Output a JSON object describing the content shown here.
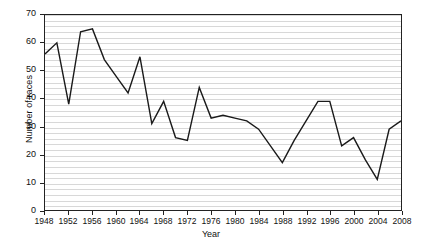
{
  "chart_data": {
    "type": "line",
    "title": "",
    "xlabel": "Year",
    "ylabel": "Number of races",
    "xlim": [
      1948,
      2008
    ],
    "ylim": [
      0,
      70
    ],
    "ytick_values": [
      0,
      10,
      20,
      30,
      40,
      50,
      60,
      70
    ],
    "ytick_labels": [
      "0",
      "10",
      "20",
      "30",
      "40",
      "50",
      "60",
      "70"
    ],
    "xtick_values": [
      1948,
      1952,
      1956,
      1960,
      1964,
      1968,
      1972,
      1976,
      1980,
      1984,
      1988,
      1992,
      1996,
      2000,
      2004,
      2008
    ],
    "xtick_labels": [
      "1948",
      "1952",
      "1956",
      "1960",
      "1964",
      "1968",
      "1972",
      "1976",
      "1980",
      "1984",
      "1988",
      "1992",
      "1996",
      "2000",
      "2004",
      "2008"
    ],
    "grid": "horizontal-dense",
    "legend": "none",
    "line_color": "#1a1a1a",
    "grid_color": "#d8d8d8",
    "axis_color": "#222222",
    "x": [
      1948,
      1950,
      1952,
      1954,
      1956,
      1958,
      1960,
      1962,
      1964,
      1966,
      1968,
      1970,
      1972,
      1974,
      1976,
      1978,
      1980,
      1982,
      1984,
      1986,
      1988,
      1990,
      1992,
      1994,
      1996,
      1998,
      2000,
      2002,
      2004,
      2006,
      2008
    ],
    "values": [
      56,
      60,
      38,
      64,
      65,
      54,
      48,
      42,
      55,
      31,
      39,
      26,
      25,
      44,
      33,
      34,
      33,
      32,
      29,
      23,
      17,
      25,
      32,
      39,
      39,
      23,
      26,
      18,
      11,
      29,
      32
    ],
    "series": [
      {
        "name": "Number of races",
        "points": [
          {
            "x": 1948,
            "y": 56
          },
          {
            "x": 1950,
            "y": 60
          },
          {
            "x": 1952,
            "y": 38
          },
          {
            "x": 1954,
            "y": 64
          },
          {
            "x": 1956,
            "y": 65
          },
          {
            "x": 1958,
            "y": 54
          },
          {
            "x": 1960,
            "y": 48
          },
          {
            "x": 1962,
            "y": 42
          },
          {
            "x": 1964,
            "y": 55
          },
          {
            "x": 1966,
            "y": 31
          },
          {
            "x": 1968,
            "y": 39
          },
          {
            "x": 1970,
            "y": 26
          },
          {
            "x": 1972,
            "y": 25
          },
          {
            "x": 1974,
            "y": 44
          },
          {
            "x": 1976,
            "y": 33
          },
          {
            "x": 1978,
            "y": 34
          },
          {
            "x": 1980,
            "y": 33
          },
          {
            "x": 1982,
            "y": 32
          },
          {
            "x": 1984,
            "y": 29
          },
          {
            "x": 1986,
            "y": 23
          },
          {
            "x": 1988,
            "y": 17
          },
          {
            "x": 1990,
            "y": 25
          },
          {
            "x": 1992,
            "y": 32
          },
          {
            "x": 1994,
            "y": 39
          },
          {
            "x": 1996,
            "y": 39
          },
          {
            "x": 1998,
            "y": 23
          },
          {
            "x": 2000,
            "y": 26
          },
          {
            "x": 2002,
            "y": 18
          },
          {
            "x": 2004,
            "y": 11
          },
          {
            "x": 2006,
            "y": 29
          },
          {
            "x": 2008,
            "y": 32
          }
        ]
      }
    ]
  }
}
